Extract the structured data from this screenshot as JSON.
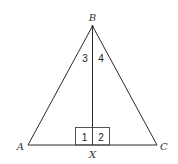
{
  "diagram": {
    "type": "geometry",
    "vertices": {
      "A": {
        "label": "A",
        "x": 28,
        "y": 145
      },
      "B": {
        "label": "B",
        "x": 92.5,
        "y": 26
      },
      "C": {
        "label": "C",
        "x": 157,
        "y": 145
      },
      "X": {
        "label": "X",
        "x": 92.5,
        "y": 145
      }
    },
    "segments": [
      {
        "from": "A",
        "to": "B"
      },
      {
        "from": "B",
        "to": "C"
      },
      {
        "from": "A",
        "to": "C"
      },
      {
        "from": "B",
        "to": "X"
      }
    ],
    "angle_labels": {
      "angle1": "1",
      "angle2": "2",
      "angle3": "3",
      "angle4": "4"
    },
    "colors": {
      "line": "#2a2a2a",
      "text": "#333333",
      "background": "#ffffff"
    }
  }
}
